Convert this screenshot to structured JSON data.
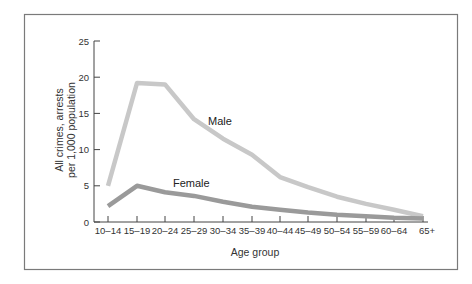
{
  "chart_data": {
    "type": "line",
    "title": "",
    "xlabel": "Age group",
    "ylabel": "All crimes, arrests per 1,000 population",
    "ylabel_lines": [
      "All crimes, arrests",
      "per 1,000 population"
    ],
    "ylim": [
      0,
      25
    ],
    "yticks": [
      0,
      5,
      10,
      15,
      20,
      25
    ],
    "grid": false,
    "legend": "inline labels",
    "categories": [
      "10–14",
      "15–19",
      "20–24",
      "25–29",
      "30–34",
      "35–39",
      "40–44",
      "45–49",
      "50–54",
      "55–59",
      "60–64",
      "65+"
    ],
    "series": [
      {
        "name": "Male",
        "color": "#c8c8c8",
        "values": [
          5.0,
          19.2,
          19.0,
          14.2,
          11.5,
          9.3,
          6.2,
          4.8,
          3.5,
          2.5,
          1.7,
          0.8
        ]
      },
      {
        "name": "Female",
        "color": "#9a9a9a",
        "values": [
          2.2,
          5.0,
          4.1,
          3.6,
          2.8,
          2.1,
          1.7,
          1.3,
          1.0,
          0.8,
          0.6,
          0.5
        ]
      }
    ],
    "annotations": [
      {
        "text": "Male",
        "category": "25–29",
        "y": 13.5
      },
      {
        "text": "Female",
        "category": "20–24",
        "y": 4.5
      }
    ]
  }
}
